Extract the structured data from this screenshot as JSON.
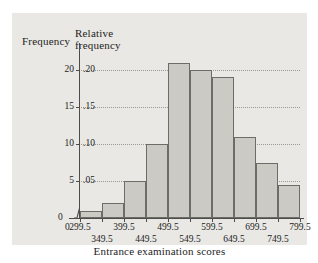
{
  "figure": {
    "left_axis_title": "Frequency",
    "right_axis_title_line1": "Relative",
    "right_axis_title_line2": "frequency",
    "x_axis_title": "Entrance examination scores",
    "origin_label_x": "0",
    "origin_label_y": "0"
  },
  "chart_data": {
    "type": "bar",
    "title": "",
    "xlabel": "Entrance examination scores",
    "ylabel": "Frequency",
    "y2label": "Relative frequency",
    "categories": [
      "299.5-349.5",
      "349.5-399.5",
      "399.5-449.5",
      "449.5-499.5",
      "499.5-549.5",
      "549.5-599.5",
      "599.5-649.5",
      "649.5-699.5",
      "699.5-749.5",
      "749.5-799.5"
    ],
    "values": [
      1,
      2,
      5,
      10,
      21,
      20,
      19,
      11,
      7.5,
      4.5
    ],
    "relative_values": [
      0.01,
      0.02,
      0.05,
      0.1,
      0.21,
      0.2,
      0.19,
      0.11,
      0.075,
      0.045
    ],
    "ylim": [
      0,
      22
    ],
    "y2lim": [
      0,
      0.22
    ],
    "yticks": [
      "0",
      "5",
      "10",
      "15",
      "20"
    ],
    "ytick_values": [
      0,
      5,
      10,
      15,
      20
    ],
    "y2ticks": [
      ".05",
      ".10",
      ".15",
      ".20"
    ],
    "y2tick_values": [
      0.05,
      0.1,
      0.15,
      0.2
    ],
    "xticks_row1": [
      "299.5",
      "399.5",
      "499.5",
      "599.5",
      "699.5",
      "799.5"
    ],
    "xticks_row2": [
      "349.5",
      "449.5",
      "549.5",
      "649.5",
      "749.5"
    ],
    "xtick_values": [
      299.5,
      349.5,
      399.5,
      449.5,
      499.5,
      549.5,
      599.5,
      649.5,
      699.5,
      749.5,
      799.5
    ],
    "grid": true,
    "grid_axis": "y",
    "legend": false,
    "bar_fill": "#cbcac4",
    "bar_edge": "#6d6d68",
    "axis_color": "#4c4c4c",
    "grid_color": "#9a9a92",
    "panel_background": "#e9e8e4",
    "axis_break_x": true
  }
}
